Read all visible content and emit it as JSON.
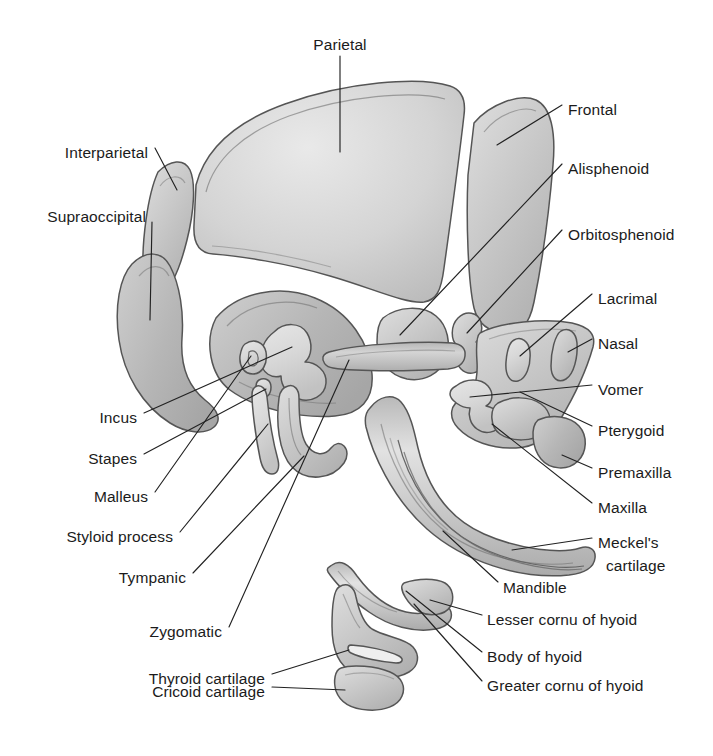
{
  "figure": {
    "background_color": "#ffffff",
    "ink_color": "#1b1b1b",
    "leader_line_color": "#222222",
    "bone_fill_light": "#dedede",
    "bone_fill_mid": "#c9c9c9",
    "bone_fill_dark": "#b4b4b4",
    "bone_outline": "#555555"
  },
  "labels": [
    {
      "id": "parietal",
      "text": "Parietal",
      "x": 340,
      "y": 45,
      "align": "c"
    },
    {
      "id": "frontal",
      "text": "Frontal",
      "x": 568,
      "y": 110,
      "align": "l"
    },
    {
      "id": "interparietal",
      "text": "Interparietal",
      "x": 148,
      "y": 153,
      "align": "r"
    },
    {
      "id": "alisphenoid",
      "text": "Alisphenoid",
      "x": 568,
      "y": 169,
      "align": "l"
    },
    {
      "id": "supraoccipital",
      "text": "Supraoccipital",
      "x": 146,
      "y": 217,
      "align": "r"
    },
    {
      "id": "orbitosphenoid",
      "text": "Orbitosphenoid",
      "x": 568,
      "y": 235,
      "align": "l"
    },
    {
      "id": "lacrimal",
      "text": "Lacrimal",
      "x": 598,
      "y": 299,
      "align": "l"
    },
    {
      "id": "nasal",
      "text": "Nasal",
      "x": 598,
      "y": 344,
      "align": "l"
    },
    {
      "id": "vomer",
      "text": "Vomer",
      "x": 598,
      "y": 390,
      "align": "l"
    },
    {
      "id": "incus",
      "text": "Incus",
      "x": 137,
      "y": 418,
      "align": "r"
    },
    {
      "id": "pterygoid",
      "text": "Pterygoid",
      "x": 598,
      "y": 431,
      "align": "l"
    },
    {
      "id": "stapes",
      "text": "Stapes",
      "x": 137,
      "y": 459,
      "align": "r"
    },
    {
      "id": "premaxilla",
      "text": "Premaxilla",
      "x": 598,
      "y": 473,
      "align": "l"
    },
    {
      "id": "malleus",
      "text": "Malleus",
      "x": 148,
      "y": 497,
      "align": "r"
    },
    {
      "id": "maxilla",
      "text": "Maxilla",
      "x": 598,
      "y": 508,
      "align": "l"
    },
    {
      "id": "styloid-process",
      "text": "Styloid process",
      "x": 173,
      "y": 537,
      "align": "r"
    },
    {
      "id": "meckels-cartilage-1",
      "text": "Meckel's",
      "x": 598,
      "y": 543,
      "align": "l"
    },
    {
      "id": "meckels-cartilage-2",
      "text": "cartilage",
      "x": 606,
      "y": 566,
      "align": "l"
    },
    {
      "id": "tympanic",
      "text": "Tympanic",
      "x": 186,
      "y": 578,
      "align": "r"
    },
    {
      "id": "mandible",
      "text": "Mandible",
      "x": 503,
      "y": 588,
      "align": "l"
    },
    {
      "id": "lesser-cornu",
      "text": "Lesser cornu of hyoid",
      "x": 487,
      "y": 620,
      "align": "l"
    },
    {
      "id": "zygomatic",
      "text": "Zygomatic",
      "x": 222,
      "y": 632,
      "align": "r"
    },
    {
      "id": "body-of-hyoid",
      "text": "Body of hyoid",
      "x": 487,
      "y": 657,
      "align": "l"
    },
    {
      "id": "thyroid-cartilage",
      "text": "Thyroid cartilage",
      "x": 265,
      "y": 679,
      "align": "r"
    },
    {
      "id": "greater-cornu",
      "text": "Greater cornu of hyoid",
      "x": 487,
      "y": 686,
      "align": "l"
    },
    {
      "id": "cricoid-cartilage",
      "text": "Cricoid cartilage",
      "x": 265,
      "y": 692,
      "align": "r"
    }
  ],
  "structures": [
    {
      "id": "parietal",
      "name": "Parietal bone"
    },
    {
      "id": "frontal",
      "name": "Frontal bone"
    },
    {
      "id": "interparietal",
      "name": "Interparietal bone"
    },
    {
      "id": "supraoccipital",
      "name": "Supraoccipital bone"
    },
    {
      "id": "alisphenoid",
      "name": "Alisphenoid"
    },
    {
      "id": "orbitosphenoid",
      "name": "Orbitosphenoid"
    },
    {
      "id": "lacrimal",
      "name": "Lacrimal bone"
    },
    {
      "id": "nasal",
      "name": "Nasal bone"
    },
    {
      "id": "vomer",
      "name": "Vomer"
    },
    {
      "id": "pterygoid",
      "name": "Pterygoid"
    },
    {
      "id": "premaxilla",
      "name": "Premaxilla"
    },
    {
      "id": "maxilla",
      "name": "Maxilla"
    },
    {
      "id": "petrous-otic",
      "name": "Otic / petrous capsule"
    },
    {
      "id": "incus",
      "name": "Incus"
    },
    {
      "id": "stapes",
      "name": "Stapes"
    },
    {
      "id": "malleus",
      "name": "Malleus"
    },
    {
      "id": "styloid-process",
      "name": "Styloid process"
    },
    {
      "id": "tympanic",
      "name": "Tympanic ring"
    },
    {
      "id": "zygomatic",
      "name": "Zygomatic bone"
    },
    {
      "id": "mandible",
      "name": "Mandible"
    },
    {
      "id": "meckels-cartilage",
      "name": "Meckel's cartilage"
    },
    {
      "id": "hyoid",
      "name": "Hyoid (body, lesser and greater cornua)"
    },
    {
      "id": "thyroid-cartilage",
      "name": "Thyroid cartilage"
    },
    {
      "id": "cricoid-cartilage",
      "name": "Cricoid cartilage"
    }
  ]
}
